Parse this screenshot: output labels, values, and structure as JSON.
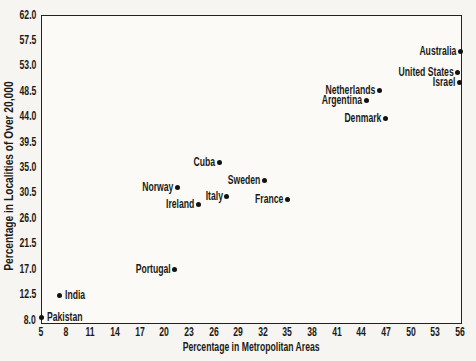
{
  "colors": {
    "ink": "#1c1a17",
    "paper": "#f6f5f1",
    "plot_background": "#fbfaf6",
    "dot": "#141210"
  },
  "chart_data": {
    "type": "scatter",
    "title": "",
    "xlabel": "Percentage in Metropolitan Areas",
    "ylabel": "Percentage in Localities of Over 20,000",
    "xlim": [
      5,
      56
    ],
    "ylim": [
      8,
      62
    ],
    "grid": false,
    "legend": "none",
    "marker": "filled-black-dot",
    "x_ticks": [
      5,
      8,
      11,
      14,
      17,
      20,
      23,
      26,
      29,
      32,
      35,
      38,
      41,
      44,
      47,
      50,
      53,
      56
    ],
    "y_ticks": [
      "8.0",
      "12.5",
      "17.0",
      "21.5",
      "26.0",
      "30.5",
      "35.0",
      "39.5",
      "44.0",
      "48.5",
      "53.0",
      "57.5",
      "62.0"
    ],
    "points": [
      {
        "label": "Australia",
        "x": 56.0,
        "y": 55.5,
        "label_side": "left"
      },
      {
        "label": "United States",
        "x": 55.7,
        "y": 51.9,
        "label_side": "left"
      },
      {
        "label": "Israel",
        "x": 55.9,
        "y": 50.1,
        "label_side": "left"
      },
      {
        "label": "Netherlands",
        "x": 46.2,
        "y": 48.6,
        "label_side": "left"
      },
      {
        "label": "Argentina",
        "x": 44.6,
        "y": 46.9,
        "label_side": "left"
      },
      {
        "label": "Denmark",
        "x": 46.9,
        "y": 43.6,
        "label_side": "left"
      },
      {
        "label": "Cuba",
        "x": 26.7,
        "y": 35.9,
        "label_side": "left"
      },
      {
        "label": "Sweden",
        "x": 32.2,
        "y": 32.7,
        "label_side": "left"
      },
      {
        "label": "Norway",
        "x": 21.6,
        "y": 31.5,
        "label_side": "left"
      },
      {
        "label": "Italy",
        "x": 27.6,
        "y": 29.9,
        "label_side": "left"
      },
      {
        "label": "France",
        "x": 35.0,
        "y": 29.3,
        "label_side": "left"
      },
      {
        "label": "Ireland",
        "x": 24.2,
        "y": 28.4,
        "label_side": "left"
      },
      {
        "label": "Portugal",
        "x": 21.3,
        "y": 16.9,
        "label_side": "left"
      },
      {
        "label": "India",
        "x": 7.3,
        "y": 12.4,
        "label_side": "right"
      },
      {
        "label": "Pakistan",
        "x": 5.1,
        "y": 8.5,
        "label_side": "right"
      }
    ]
  }
}
